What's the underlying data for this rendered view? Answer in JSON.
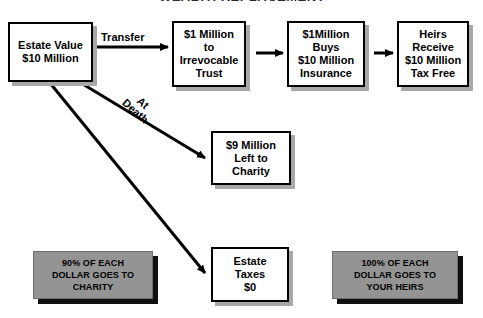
{
  "page": {
    "background_color": "#ffffff",
    "title_partial": "WEALTH REPLACEMENT"
  },
  "colors": {
    "box_fill": "#ffffff",
    "box_border": "#000000",
    "box_shadow": "#a8a8a8",
    "gray_box_fill": "#949494",
    "gray_box_shadow": "#101010",
    "arrow": "#000000",
    "text": "#000000"
  },
  "nodes": [
    {
      "id": "estate-value",
      "style": "white",
      "text": "Estate Value\n$10 Million",
      "x": 8,
      "y": 22,
      "w": 85,
      "h": 60
    },
    {
      "id": "irrevocable-trust",
      "style": "white",
      "text": "$1 Million\nto\nIrrevocable\nTrust",
      "x": 172,
      "y": 21,
      "w": 74,
      "h": 66
    },
    {
      "id": "insurance",
      "style": "white",
      "text": "$1Million\nBuys\n$10 Million\nInsurance",
      "x": 287,
      "y": 21,
      "w": 78,
      "h": 66
    },
    {
      "id": "heirs-receive",
      "style": "white",
      "text": "Heirs\nReceive\n$10 Million\nTax Free",
      "x": 397,
      "y": 21,
      "w": 72,
      "h": 66
    },
    {
      "id": "charity-remainder",
      "style": "white",
      "text": "$9 Million\nLeft to\nCharity",
      "x": 211,
      "y": 131,
      "w": 80,
      "h": 54
    },
    {
      "id": "estate-taxes",
      "style": "white",
      "text": "Estate\nTaxes\n$0",
      "x": 211,
      "y": 247,
      "w": 78,
      "h": 55
    },
    {
      "id": "charity-result",
      "style": "gray",
      "text": "90% OF EACH\nDOLLAR GOES TO\nCHARITY",
      "x": 33,
      "y": 251,
      "w": 120,
      "h": 48
    },
    {
      "id": "heirs-result",
      "style": "gray",
      "text": "100% OF EACH\nDOLLAR GOES TO\nYOUR HEIRS",
      "x": 332,
      "y": 251,
      "w": 126,
      "h": 48
    }
  ],
  "edges": [
    {
      "id": "transfer-arrow",
      "label": "Transfer",
      "from": "estate-value",
      "to": "irrevocable-trust",
      "path": "M 96 47 L 168 47",
      "label_x": 101,
      "label_y": 32,
      "label_rotated": false
    },
    {
      "id": "trust-to-insurance-arrow",
      "label": "",
      "from": "irrevocable-trust",
      "to": "insurance",
      "path": "M 256 53 L 283 53",
      "label_x": 0,
      "label_y": 0,
      "label_rotated": false
    },
    {
      "id": "insurance-to-heirs-arrow",
      "label": "",
      "from": "insurance",
      "to": "heirs-receive",
      "path": "M 374 53 L 393 53",
      "label_x": 0,
      "label_y": 0,
      "label_rotated": false
    },
    {
      "id": "at-death-arrow",
      "label": "At\nDeath",
      "from": "estate-value",
      "to": "charity-remainder",
      "path": "M 81 83 L 205 158",
      "label_x": 135,
      "label_y": 89,
      "label_rotated": true
    },
    {
      "id": "estate-taxes-arrow",
      "label": "",
      "from": "estate-value",
      "to": "estate-taxes",
      "path": "M 50 83 L 205 273",
      "label_x": 0,
      "label_y": 0,
      "label_rotated": false
    }
  ]
}
